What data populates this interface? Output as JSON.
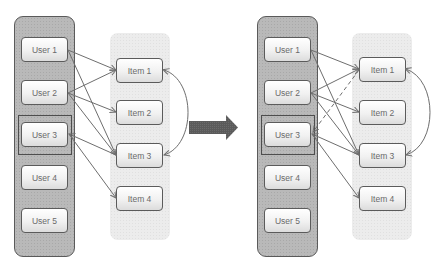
{
  "diagram": {
    "before": {
      "users": [
        {
          "id": "u1",
          "label": "User 1"
        },
        {
          "id": "u2",
          "label": "User 2"
        },
        {
          "id": "u3",
          "label": "User 3",
          "highlighted": true
        },
        {
          "id": "u4",
          "label": "User 4"
        },
        {
          "id": "u5",
          "label": "User 5"
        }
      ],
      "items": [
        {
          "id": "i1",
          "label": "Item 1"
        },
        {
          "id": "i2",
          "label": "Item 2"
        },
        {
          "id": "i3",
          "label": "Item 3"
        },
        {
          "id": "i4",
          "label": "Item 4"
        }
      ],
      "edges": [
        {
          "from": "User 1",
          "to": "Item 1",
          "style": "solid"
        },
        {
          "from": "User 1",
          "to": "Item 3",
          "style": "solid"
        },
        {
          "from": "User 2",
          "to": "Item 1",
          "style": "solid"
        },
        {
          "from": "User 2",
          "to": "Item 2",
          "style": "solid"
        },
        {
          "from": "User 2",
          "to": "Item 3",
          "style": "solid"
        },
        {
          "from": "Item 3",
          "to": "User 3",
          "style": "solid"
        },
        {
          "from": "User 3",
          "to": "Item 4",
          "style": "solid"
        },
        {
          "from": "Item 1",
          "to": "Item 3",
          "style": "curved-bidirectional"
        }
      ]
    },
    "transition_arrow": "right-arrow",
    "after": {
      "users": [
        {
          "id": "u1",
          "label": "User 1"
        },
        {
          "id": "u2",
          "label": "User 2"
        },
        {
          "id": "u3",
          "label": "User 3",
          "highlighted": true
        },
        {
          "id": "u4",
          "label": "User 4"
        },
        {
          "id": "u5",
          "label": "User 5"
        }
      ],
      "items": [
        {
          "id": "i1",
          "label": "Item 1"
        },
        {
          "id": "i2",
          "label": "Item 2"
        },
        {
          "id": "i3",
          "label": "Item 3"
        },
        {
          "id": "i4",
          "label": "Item 4"
        }
      ],
      "edges": [
        {
          "from": "User 1",
          "to": "Item 1",
          "style": "solid"
        },
        {
          "from": "User 1",
          "to": "Item 3",
          "style": "solid"
        },
        {
          "from": "User 2",
          "to": "Item 1",
          "style": "solid"
        },
        {
          "from": "User 2",
          "to": "Item 2",
          "style": "solid"
        },
        {
          "from": "User 2",
          "to": "Item 3",
          "style": "solid"
        },
        {
          "from": "Item 3",
          "to": "User 3",
          "style": "solid"
        },
        {
          "from": "User 3",
          "to": "Item 4",
          "style": "solid"
        },
        {
          "from": "Item 1",
          "to": "User 3",
          "style": "dashed"
        },
        {
          "from": "Item 1",
          "to": "Item 3",
          "style": "curved-bidirectional"
        }
      ]
    },
    "colors": {
      "user_panel": "#b9b9b9",
      "item_panel": "#ececec",
      "node_border": "#5b5b5b",
      "edge": "#6e6e6e",
      "arrow": "#565656"
    }
  }
}
